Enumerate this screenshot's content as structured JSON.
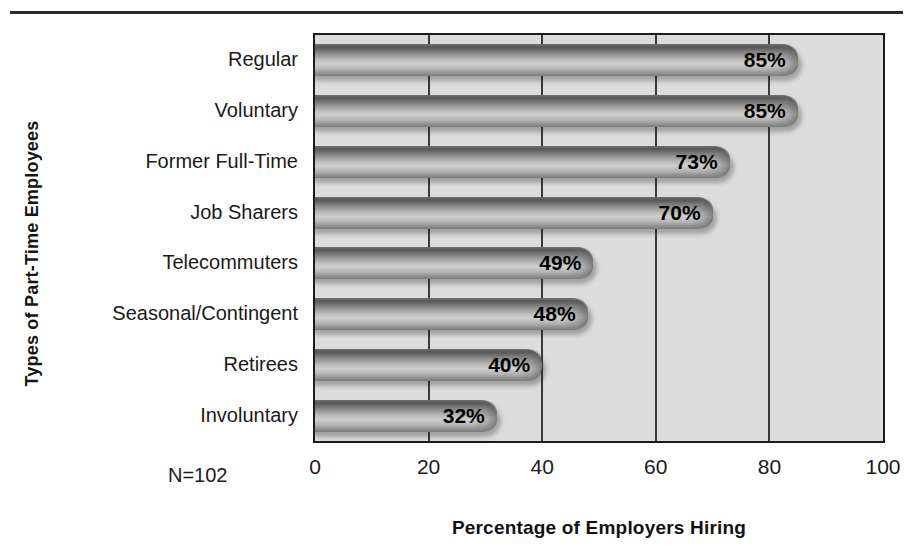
{
  "chart_data": {
    "type": "bar",
    "orientation": "horizontal",
    "title": "",
    "xlabel": "Percentage of Employers Hiring",
    "ylabel": "Types of Part-Time Employees",
    "xlim": [
      0,
      100
    ],
    "xticks": [
      0,
      20,
      40,
      60,
      80,
      100
    ],
    "xtick_labels": [
      "0",
      "20",
      "40",
      "60",
      "80",
      "100"
    ],
    "grid": true,
    "grid_axis": "x",
    "legend": false,
    "value_label_suffix": "%",
    "annotation": "N=102",
    "categories": [
      "Regular",
      "Voluntary",
      "Former Full-Time",
      "Job Sharers",
      "Telecommuters",
      "Seasonal/Contingent",
      "Retirees",
      "Involuntary"
    ],
    "values": [
      85,
      85,
      73,
      70,
      49,
      48,
      40,
      32
    ],
    "value_labels": [
      "85%",
      "85%",
      "73%",
      "70%",
      "49%",
      "48%",
      "40%",
      "32%"
    ],
    "colors": {
      "plot_background": "#dcdcdc",
      "plot_border": "#1c1c1c",
      "gridline": "#3a3a3a",
      "bar_light": "#cfcfcf",
      "bar_dark": "#575757",
      "text": "#1a1a1a",
      "page_background": "#ffffff"
    }
  }
}
